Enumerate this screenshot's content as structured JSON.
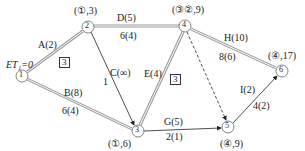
{
  "diagram": {
    "type": "activity-on-arrow network",
    "start_label": "ET₁=0",
    "nodes": [
      {
        "id": "1",
        "label": "1",
        "x": 22,
        "y": 76,
        "annotation": ""
      },
      {
        "id": "2",
        "label": "2",
        "x": 88,
        "y": 27,
        "annotation": "(①,3)"
      },
      {
        "id": "3",
        "label": "3",
        "x": 138,
        "y": 131,
        "annotation": "(①,6)"
      },
      {
        "id": "4",
        "label": "4",
        "x": 185,
        "y": 26,
        "annotation": "(③②,9)"
      },
      {
        "id": "5",
        "label": "5",
        "x": 228,
        "y": 127,
        "annotation": "(④,9)"
      },
      {
        "id": "6",
        "label": "6",
        "x": 282,
        "y": 71,
        "annotation": "(④,17)"
      }
    ],
    "edges": [
      {
        "from": "1",
        "to": "2",
        "name": "A(2)",
        "value": "",
        "critical": true
      },
      {
        "from": "1",
        "to": "3",
        "name": "B(8)",
        "value": "6(4)",
        "critical": true
      },
      {
        "from": "2",
        "to": "3",
        "name": "C(∞)",
        "value": "1",
        "critical": false
      },
      {
        "from": "2",
        "to": "4",
        "name": "D(5)",
        "value": "6(4)",
        "critical": true
      },
      {
        "from": "3",
        "to": "4",
        "name": "E(4)",
        "value": "",
        "critical": true
      },
      {
        "from": "3",
        "to": "5",
        "name": "G(5)",
        "value": "2(1)",
        "critical": false
      },
      {
        "from": "4",
        "to": "5",
        "name": "dummy",
        "value": "",
        "critical": false,
        "dashed": true
      },
      {
        "from": "4",
        "to": "6",
        "name": "H(10)",
        "value": "8(6)",
        "critical": true
      },
      {
        "from": "5",
        "to": "6",
        "name": "I(2)",
        "value": "4(2)",
        "critical": false
      }
    ],
    "boxes": [
      {
        "label": "3",
        "near": "A"
      },
      {
        "label": "3",
        "near": "E"
      }
    ]
  }
}
